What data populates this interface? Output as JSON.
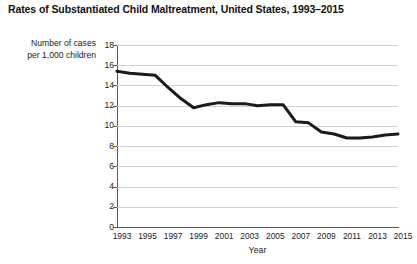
{
  "chart_data": {
    "type": "line",
    "title": "Rates of Substantiated Child Maltreatment, United States, 1993–2015",
    "xlabel": "Year",
    "ylabel": "Number of cases per 1,000 children",
    "ylabel_line1": "Number of cases",
    "ylabel_line2": "per 1,000 children",
    "xlim": [
      1993,
      2015
    ],
    "ylim": [
      0,
      18
    ],
    "yticks": [
      0,
      2,
      4,
      6,
      8,
      10,
      12,
      14,
      16,
      18
    ],
    "xticks": [
      1993,
      1995,
      1997,
      1999,
      2001,
      2003,
      2005,
      2007,
      2009,
      2011,
      2013,
      2015
    ],
    "grid": "horizontal",
    "legend": "none",
    "line_color": "#1a1a1a",
    "line_width": 3,
    "x": [
      1993,
      1994,
      1995,
      1996,
      1997,
      1998,
      1999,
      2000,
      2001,
      2002,
      2003,
      2004,
      2005,
      2006,
      2007,
      2008,
      2009,
      2010,
      2011,
      2012,
      2013,
      2014,
      2015
    ],
    "values": [
      15.4,
      15.2,
      15.1,
      15.0,
      13.8,
      12.7,
      11.8,
      12.1,
      12.3,
      12.2,
      12.2,
      12.0,
      12.1,
      12.1,
      10.4,
      10.3,
      9.4,
      9.2,
      8.8,
      8.8,
      8.9,
      9.1,
      9.2
    ],
    "series": [
      {
        "name": "Substantiated child maltreatment rate",
        "values": [
          15.4,
          15.2,
          15.1,
          15.0,
          13.8,
          12.7,
          11.8,
          12.1,
          12.3,
          12.2,
          12.2,
          12.0,
          12.1,
          12.1,
          10.4,
          10.3,
          9.4,
          9.2,
          8.8,
          8.8,
          8.9,
          9.1,
          9.2
        ]
      }
    ]
  }
}
